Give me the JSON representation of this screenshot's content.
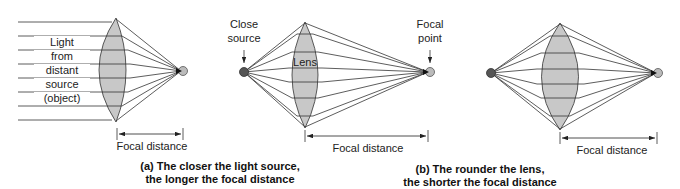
{
  "panel_a": {
    "ray_labels": [
      "Light",
      "from",
      "distant",
      "source",
      "(object)"
    ],
    "focal_label": "Focal distance",
    "caption_line1": "(a) The closer the light source,",
    "caption_line2": "the longer the focal distance"
  },
  "panel_b": {
    "source_label_line1": "Close",
    "source_label_line2": "source",
    "lens_label": "Lens",
    "focal_point_line1": "Focal",
    "focal_point_line2": "point",
    "focal_label": "Focal distance",
    "caption_line1": "(b) The rounder the lens,",
    "caption_line2": "the shorter the focal distance"
  },
  "panel_c": {
    "focal_label": "Focal distance"
  },
  "colors": {
    "lens_fill": "#c8c8c8",
    "line": "#333333",
    "source_dot": "#555555",
    "focal_dot": "#bbbbbb"
  }
}
